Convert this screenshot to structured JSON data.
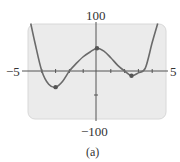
{
  "chart_data": {
    "type": "line",
    "title": "",
    "caption": "(a)",
    "xlabel": "",
    "ylabel": "",
    "xlim": [
      -5,
      5
    ],
    "ylim": [
      -100,
      100
    ],
    "x_tick_labels": [
      "-5",
      "5"
    ],
    "y_tick_labels": [
      "100",
      "-100"
    ],
    "grid": false,
    "colors": {
      "plot_bg": "#ebebeb",
      "curve": "#6a6a6a",
      "axis": "#555555",
      "dot": "#555555"
    },
    "series": [
      {
        "name": "f(x)",
        "x": [
          -4.8,
          -4.5,
          -4.0,
          -3.5,
          -3.0,
          -2.5,
          -2.0,
          -1.5,
          -1.0,
          -0.5,
          0.0,
          0.5,
          1.0,
          1.5,
          2.0,
          2.5,
          3.0,
          3.5,
          4.0,
          4.4
        ],
        "y": [
          100,
          60,
          0,
          -28,
          -34,
          -22,
          0,
          16,
          30,
          40,
          48,
          42,
          28,
          12,
          0,
          -10,
          -4,
          6,
          60,
          100
        ]
      }
    ],
    "highlighted_points": [
      {
        "label": "local min",
        "x": -3.0,
        "y": -34
      },
      {
        "label": "local max",
        "x": 0.0,
        "y": 48
      },
      {
        "label": "local min",
        "x": 2.5,
        "y": -10
      }
    ]
  },
  "labels": {
    "y_max": "100",
    "y_min": "−100",
    "x_min": "−5",
    "x_max": "5",
    "caption": "(a)"
  }
}
